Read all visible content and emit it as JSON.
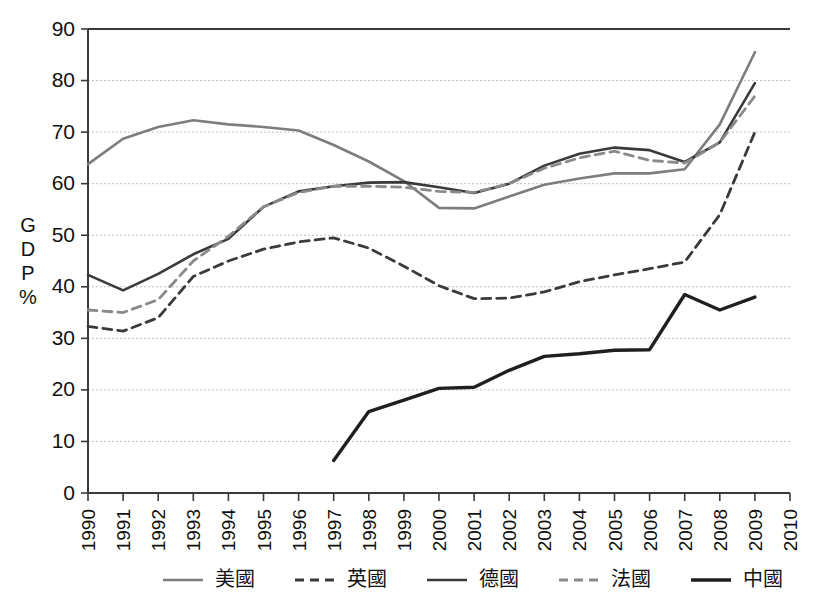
{
  "chart_data": {
    "type": "line",
    "title": "",
    "xlabel": "",
    "ylabel": "GDP %",
    "ylabel_chars": [
      "G",
      "D",
      "P",
      "%"
    ],
    "ylim": [
      0,
      90
    ],
    "ytick_step": 10,
    "yticks": [
      "0",
      "10",
      "20",
      "30",
      "40",
      "50",
      "60",
      "70",
      "80",
      "90"
    ],
    "xlim": [
      1990,
      2010
    ],
    "grid": true,
    "legend_position": "bottom",
    "categories": [
      "1990",
      "1991",
      "1992",
      "1993",
      "1994",
      "1995",
      "1996",
      "1997",
      "1998",
      "1999",
      "2000",
      "2001",
      "2002",
      "2003",
      "2004",
      "2005",
      "2006",
      "2007",
      "2008",
      "2009",
      "2010"
    ],
    "series": [
      {
        "name": "美國",
        "legend_label": "美國",
        "color": "#7d7d7d",
        "style": "solid",
        "width": 2.6,
        "x": [
          1990,
          1991,
          1992,
          1993,
          1994,
          1995,
          1996,
          1997,
          1998,
          1999,
          2000,
          2001,
          2002,
          2003,
          2004,
          2005,
          2006,
          2007,
          2008,
          2009
        ],
        "values": [
          63.8,
          68.7,
          71.0,
          72.3,
          71.5,
          71.0,
          70.3,
          67.5,
          64.3,
          60.5,
          55.3,
          55.2,
          57.5,
          59.8,
          61.0,
          62.0,
          62.0,
          62.8,
          71.5,
          85.5
        ]
      },
      {
        "name": "英國",
        "legend_label": "英國",
        "color": "#3a3a3a",
        "style": "dashed",
        "width": 2.8,
        "x": [
          1990,
          1991,
          1992,
          1993,
          1994,
          1995,
          1996,
          1997,
          1998,
          1999,
          2000,
          2001,
          2002,
          2003,
          2004,
          2005,
          2006,
          2007,
          2008,
          2009
        ],
        "values": [
          32.3,
          31.4,
          34.0,
          42.0,
          45.0,
          47.3,
          48.7,
          49.5,
          47.5,
          44.0,
          40.2,
          37.7,
          37.8,
          39.0,
          41.0,
          42.3,
          43.5,
          44.8,
          54.0,
          70.0
        ]
      },
      {
        "name": "德國",
        "legend_label": "德國",
        "color": "#3a3a3a",
        "style": "solid",
        "width": 2.6,
        "x": [
          1990,
          1991,
          1992,
          1993,
          1994,
          1995,
          1996,
          1997,
          1998,
          1999,
          2000,
          2001,
          2002,
          2003,
          2004,
          2005,
          2006,
          2007,
          2008,
          2009
        ],
        "values": [
          42.3,
          39.3,
          42.5,
          46.3,
          49.3,
          55.5,
          58.5,
          59.5,
          60.2,
          60.3,
          59.3,
          58.2,
          60.0,
          63.5,
          65.8,
          67.0,
          66.5,
          64.2,
          68.0,
          79.5
        ]
      },
      {
        "name": "法國",
        "legend_label": "法國",
        "color": "#8a8a8a",
        "style": "dashed",
        "width": 2.8,
        "x": [
          1990,
          1991,
          1992,
          1993,
          1994,
          1995,
          1996,
          1997,
          1998,
          1999,
          2000,
          2001,
          2002,
          2003,
          2004,
          2005,
          2006,
          2007,
          2008,
          2009
        ],
        "values": [
          35.5,
          35.0,
          37.5,
          45.0,
          49.8,
          55.5,
          58.3,
          59.5,
          59.5,
          59.3,
          58.5,
          58.3,
          60.0,
          63.0,
          65.0,
          66.3,
          64.5,
          64.0,
          68.0,
          77.0
        ]
      },
      {
        "name": "中國",
        "legend_label": "中國",
        "color": "#1f1f1f",
        "style": "solid",
        "width": 3.4,
        "x": [
          1997,
          1998,
          1999,
          2000,
          2001,
          2002,
          2003,
          2004,
          2005,
          2006,
          2007,
          2008,
          2009
        ],
        "values": [
          6.3,
          15.8,
          18.0,
          20.3,
          20.5,
          23.8,
          26.5,
          27.0,
          27.7,
          27.8,
          38.5,
          35.5,
          38.0
        ]
      }
    ]
  }
}
